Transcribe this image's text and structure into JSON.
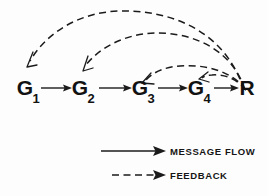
{
  "figure": {
    "background_color": "#fdfdfd",
    "ink_color": "#1b1b1b"
  },
  "nodes": [
    {
      "id": "g1",
      "label": "G",
      "subscript": "1",
      "x": 25,
      "y": 95
    },
    {
      "id": "g2",
      "label": "G",
      "subscript": "2",
      "x": 80,
      "y": 95
    },
    {
      "id": "g3",
      "label": "G",
      "subscript": "3",
      "x": 140,
      "y": 95
    },
    {
      "id": "g4",
      "label": "G",
      "subscript": "4",
      "x": 196,
      "y": 95
    },
    {
      "id": "r",
      "label": "R",
      "subscript": "",
      "x": 246,
      "y": 95
    }
  ],
  "message_flow_edges": [
    {
      "from": "g1",
      "to": "g2",
      "style": "solid",
      "direction": "right"
    },
    {
      "from": "g2",
      "to": "g3",
      "style": "solid",
      "direction": "right"
    },
    {
      "from": "g3",
      "to": "g4",
      "style": "solid",
      "direction": "right"
    },
    {
      "from": "g4",
      "to": "r",
      "style": "solid",
      "direction": "right"
    }
  ],
  "feedback_edges": [
    {
      "from": "r",
      "to": "g1",
      "style": "dashed",
      "apex_y": 12
    },
    {
      "from": "r",
      "to": "g2",
      "style": "dashed",
      "apex_y": 32
    },
    {
      "from": "r",
      "to": "g3",
      "style": "dashed",
      "apex_y": 66
    },
    {
      "from": "r",
      "to": "g4",
      "style": "dashed",
      "apex_y": 79
    }
  ],
  "legend": {
    "items": [
      {
        "id": "message-flow",
        "label": "MESSAGE   FLOW",
        "style": "solid"
      },
      {
        "id": "feedback",
        "label": "FEEDBACK",
        "style": "dashed"
      }
    ]
  }
}
